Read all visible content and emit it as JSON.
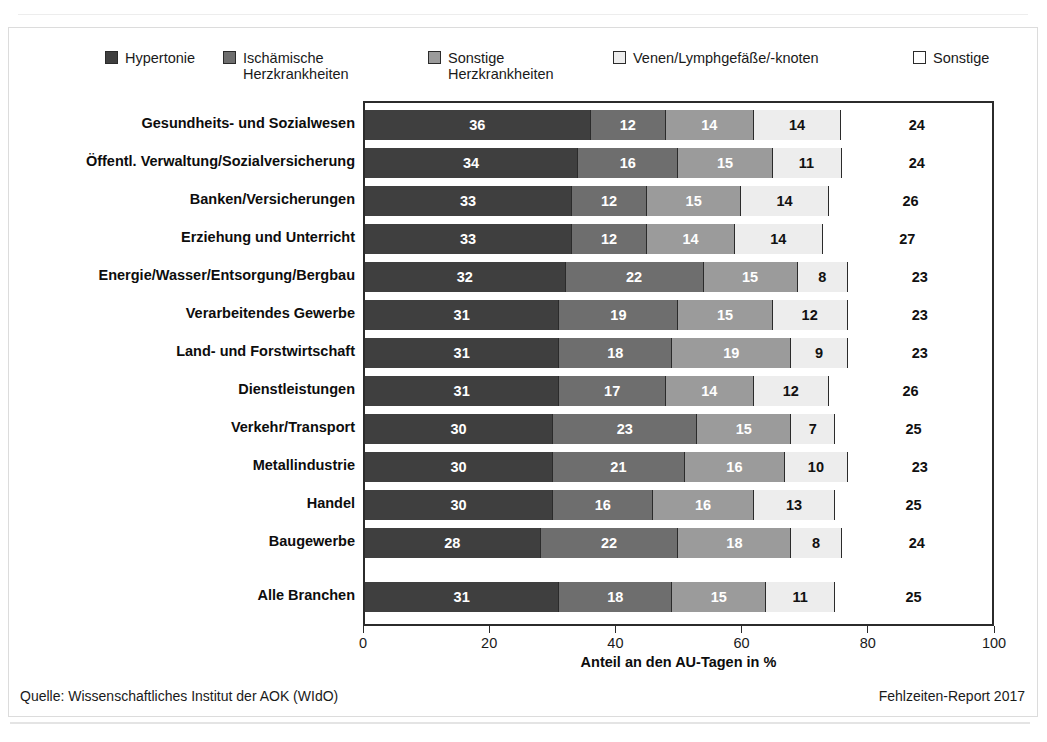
{
  "chart_data": {
    "type": "bar",
    "orientation": "horizontal",
    "stacked": true,
    "normalized_percent": true,
    "title": "",
    "xlabel": "Anteil an den AU-Tagen in %",
    "ylabel": "",
    "xlim": [
      0,
      100
    ],
    "xticks": [
      0,
      20,
      40,
      60,
      80,
      100
    ],
    "xtick_labels": [
      "0",
      "20",
      "40",
      "60",
      "80",
      "100"
    ],
    "grid": false,
    "legend_position": "top",
    "categories": [
      "Gesundheits- und Sozialwesen",
      "Öffentl. Verwaltung/Sozialversicherung",
      "Banken/Versicherungen",
      "Erziehung und Unterricht",
      "Energie/Wasser/Entsorgung/Bergbau",
      "Verarbeitendes Gewerbe",
      "Land- und Forstwirtschaft",
      "Dienstleistungen",
      "Verkehr/Transport",
      "Metallindustrie",
      "Handel",
      "Baugewerbe",
      "Alle Branchen"
    ],
    "series": [
      {
        "name": "Hypertonie",
        "color": "#3f3f3f",
        "text_color": "#ffffff",
        "values": [
          36,
          34,
          33,
          33,
          32,
          31,
          31,
          31,
          30,
          30,
          30,
          28,
          31
        ]
      },
      {
        "name": "Ischämische\nHerzkrankheiten",
        "color": "#6e6e6e",
        "text_color": "#ffffff",
        "values": [
          12,
          16,
          12,
          12,
          22,
          19,
          18,
          17,
          23,
          21,
          16,
          22,
          18
        ]
      },
      {
        "name": "Sonstige\nHerzkrankheiten",
        "color": "#9b9b9b",
        "text_color": "#ffffff",
        "values": [
          14,
          15,
          15,
          14,
          15,
          15,
          19,
          14,
          15,
          16,
          16,
          18,
          15
        ]
      },
      {
        "name": "Venen/Lymphgefäße/-knoten",
        "color": "#ededed",
        "text_color": "#111111",
        "values": [
          14,
          11,
          14,
          14,
          8,
          12,
          9,
          12,
          7,
          10,
          13,
          8,
          11
        ]
      },
      {
        "name": "Sonstige",
        "color": "#ffffff",
        "text_color": "#111111",
        "values": [
          24,
          24,
          26,
          27,
          23,
          23,
          23,
          26,
          25,
          23,
          25,
          24,
          25
        ]
      }
    ]
  },
  "footer": {
    "source": "Quelle: Wissenschaftliches Institut der AOK (WIdO)",
    "report": "Fehlzeiten-Report 2017"
  }
}
